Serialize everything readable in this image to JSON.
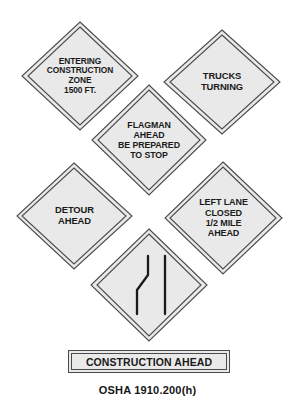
{
  "figure": {
    "title_caption": "OSHA 1910.200(h)",
    "background_color": "#ffffff",
    "sign_fill_color": "#e9e9e9",
    "sign_border_color": "#4a4a4a",
    "text_color": "#1a1a1a"
  },
  "signs": [
    {
      "id": "entering-construction-zone",
      "shape": "diamond",
      "lines": [
        "ENTERING",
        "CONSTRUCTION",
        "ZONE",
        "1500 FT."
      ],
      "font_size": "8.4px"
    },
    {
      "id": "trucks-turning",
      "shape": "diamond",
      "lines": [
        "TRUCKS",
        "TURNING"
      ],
      "font_size": "9.4px"
    },
    {
      "id": "flagman-ahead",
      "shape": "diamond",
      "lines": [
        "FLAGMAN",
        "AHEAD",
        "BE PREPARED",
        "TO STOP"
      ],
      "font_size": "8.8px"
    },
    {
      "id": "detour-ahead",
      "shape": "diamond",
      "lines": [
        "DETOUR",
        "AHEAD"
      ],
      "font_size": "9.4px"
    },
    {
      "id": "left-lane-closed",
      "shape": "diamond",
      "lines": [
        "LEFT LANE",
        "CLOSED",
        "1/2 MILE",
        "AHEAD"
      ],
      "font_size": "9px"
    },
    {
      "id": "lane-shift-symbol",
      "shape": "diamond",
      "lines": [],
      "symbol": "lane-shift-pictogram",
      "font_size": "9px"
    }
  ],
  "rect_sign": {
    "id": "construction-ahead",
    "shape": "rectangle",
    "label": "CONSTRUCTION AHEAD"
  }
}
